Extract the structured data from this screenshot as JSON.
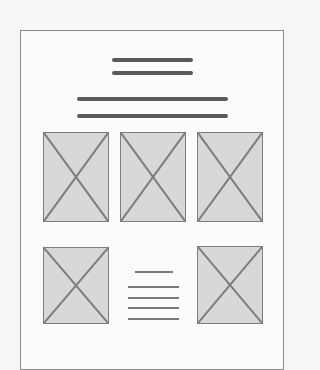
{
  "wireframe": {
    "title_lines": 2,
    "subtitle_lines": 2,
    "image_placeholders": [
      {
        "row": 1,
        "col": 1
      },
      {
        "row": 1,
        "col": 2
      },
      {
        "row": 1,
        "col": 3
      },
      {
        "row": 2,
        "col": 1
      },
      {
        "row": 2,
        "col": 3
      }
    ],
    "text_block_lines": 5,
    "colors": {
      "line": "#5a5a5a",
      "placeholder_fill": "#d8d8d8",
      "border": "#8a8a8a"
    }
  }
}
